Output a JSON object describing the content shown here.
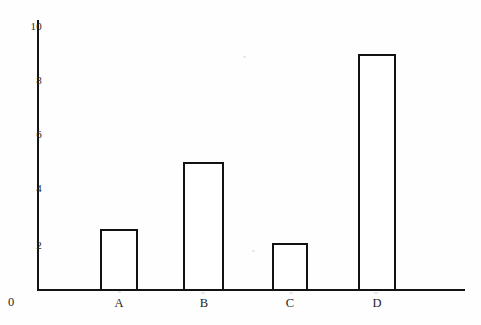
{
  "chart_data": {
    "type": "bar",
    "title": "",
    "subtitle": "",
    "xlabel": "",
    "ylabel": "",
    "categories": [
      "A",
      "B",
      "C",
      "D"
    ],
    "values": [
      2.3,
      4.8,
      1.8,
      8.8
    ],
    "ylim": [
      0,
      10
    ],
    "y_ticks": [
      0,
      2,
      4,
      6,
      8,
      10
    ],
    "y_tick_labels": [
      "0",
      "2",
      "4",
      "6",
      "8",
      "10"
    ],
    "x_tick_labels": [
      "A",
      "B",
      "C",
      "D"
    ],
    "grid": false,
    "legend": null,
    "legend_position": "none",
    "annotations": [],
    "series": [
      {
        "name": "",
        "values": [
          2.3,
          4.8,
          1.8,
          8.8
        ]
      }
    ],
    "style": {
      "bar_fill": "#ffffff",
      "bar_edge": "#121212",
      "axis_color": "#141414",
      "background": "#fefefe",
      "text_color": "#1f1f1f"
    }
  },
  "axes": {
    "y": {
      "ticks": [
        {
          "label": "10",
          "value": 10
        },
        {
          "label": "8",
          "value": 8
        },
        {
          "label": "6",
          "value": 6
        },
        {
          "label": "4",
          "value": 4
        },
        {
          "label": "2",
          "value": 2
        }
      ],
      "origin_label": "0"
    },
    "x": {
      "ticks": [
        {
          "label": "A"
        },
        {
          "label": "B"
        },
        {
          "label": "C"
        },
        {
          "label": "D"
        }
      ]
    }
  }
}
